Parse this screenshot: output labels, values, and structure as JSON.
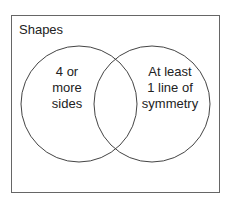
{
  "diagram": {
    "type": "venn",
    "universe": {
      "label": "Shapes"
    },
    "sets": [
      {
        "id": "A",
        "label_lines": [
          "4 or",
          "more",
          "sides"
        ]
      },
      {
        "id": "B",
        "label_lines": [
          "At least",
          "1 line of",
          "symmetry"
        ]
      }
    ],
    "colors": {
      "background": "#ffffff",
      "border": "#555555",
      "circle_stroke": "#444444",
      "text": "#222222"
    }
  }
}
